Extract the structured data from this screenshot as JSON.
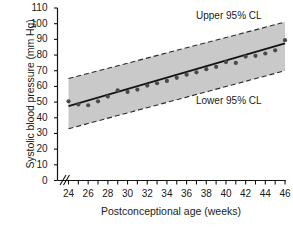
{
  "chart_data": {
    "type": "scatter",
    "title": "",
    "xlabel": "Postconceptional age (weeks)",
    "ylabel": "Systolic blood pressure (mm Hg)",
    "xlim": [
      24,
      46
    ],
    "ylim": [
      0,
      110
    ],
    "y_ticks": [
      110,
      100,
      90,
      80,
      70,
      60,
      50,
      40,
      30,
      20,
      10,
      0
    ],
    "x_ticks_labeled": [
      24,
      26,
      28,
      30,
      32,
      34,
      36,
      38,
      40,
      42,
      44,
      46
    ],
    "x_minor_tick_step": 1,
    "grid": false,
    "legend_position": "inside-annotations",
    "axis_break_x": true,
    "axis_break_y": false,
    "band_fill_color": "#c9c9c9",
    "line_color": "#1a1a1a",
    "point_color": "#4a4a4a",
    "annotations": [
      {
        "text": "Upper 95% CL",
        "x": 40.5,
        "y": 104
      },
      {
        "text": "Lower 95% CL",
        "x": 40.5,
        "y": 48
      }
    ],
    "series": [
      {
        "name": "Regression line",
        "type": "line",
        "x": [
          24,
          46
        ],
        "values": [
          47.5,
          87.5
        ]
      },
      {
        "name": "Upper 95% CL",
        "type": "line",
        "style": "dashed",
        "x": [
          24,
          46
        ],
        "values": [
          65.0,
          101.0
        ]
      },
      {
        "name": "Lower 95% CL",
        "type": "line",
        "style": "dashed",
        "x": [
          24,
          46
        ],
        "values": [
          33.0,
          70.0
        ]
      },
      {
        "name": "Mean systolic blood pressure",
        "type": "scatter",
        "x": [
          24,
          25,
          26,
          27,
          28,
          29,
          30,
          31,
          32,
          33,
          34,
          35,
          36,
          37,
          38,
          39,
          40,
          41,
          42,
          43,
          44,
          45,
          46
        ],
        "values": [
          50.5,
          48.5,
          48.0,
          50.5,
          53.5,
          57.5,
          56.5,
          58.0,
          60.5,
          62.0,
          63.5,
          65.5,
          67.5,
          69.0,
          71.0,
          72.5,
          75.5,
          75.0,
          79.0,
          79.5,
          81.0,
          83.0,
          89.5
        ]
      }
    ]
  },
  "figure": {
    "bottom_artifact": ""
  }
}
